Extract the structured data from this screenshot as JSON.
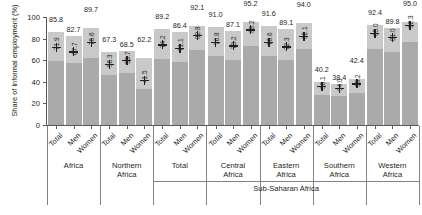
{
  "chart_data": {
    "type": "bar",
    "title": "",
    "xlabel": "",
    "ylabel": "Share of informal employment (%)",
    "ylim": [
      0,
      100
    ],
    "yticks": [
      "0",
      "20",
      "40",
      "60",
      "80",
      "100"
    ],
    "grid": false,
    "legend": "none",
    "categories": [
      "Total",
      "Men",
      "Women",
      "Total",
      "Men",
      "Women",
      "Total",
      "Men",
      "Women",
      "Total",
      "Men",
      "Women",
      "Total",
      "Men",
      "Women",
      "Total",
      "Men",
      "Women",
      "Total",
      "Men",
      "Women"
    ],
    "groups": [
      {
        "label": "Africa",
        "labels": [
          "Total",
          "Men",
          "Women"
        ]
      },
      {
        "label": "Northern\nAfrica",
        "line1": "Northern",
        "line2": "Africa",
        "labels": [
          "Total",
          "Men",
          "Women"
        ]
      },
      {
        "label": "Total",
        "line1": "Total",
        "line2": "",
        "labels": [
          "Total",
          "Men",
          "Women"
        ]
      },
      {
        "label": "Central\nAfrica",
        "line1": "Central",
        "line2": "Africa",
        "labels": [
          "Total",
          "Men",
          "Women"
        ]
      },
      {
        "label": "Eastern\nAfrica",
        "line1": "Eastern",
        "line2": "Africa",
        "labels": [
          "Total",
          "Men",
          "Women"
        ]
      },
      {
        "label": "Southern\nAfrica",
        "line1": "Southern",
        "line2": "Africa",
        "labels": [
          "Total",
          "Men",
          "Women"
        ]
      },
      {
        "label": "Western\nAfrica",
        "line1": "Western",
        "line2": "Africa",
        "labels": [
          "Total",
          "Men",
          "Women"
        ]
      }
    ],
    "supergroup_label": "Sub-Saharan Africa",
    "series": [
      {
        "name": "Share of informal employment (%)",
        "values": [
          85.8,
          82.7,
          89.7,
          67.3,
          68.5,
          62.2,
          89.2,
          86.4,
          92.1,
          91.0,
          87.1,
          95.2,
          91.6,
          89.1,
          94.0,
          40.2,
          38.4,
          42.4,
          92.4,
          89.8,
          95.0
        ]
      },
      {
        "name": "Informal employment in the informal sector (marker)",
        "values": [
          71.9,
          67.7,
          76.6,
          56.3,
          59.7,
          41.5,
          74.2,
          71.1,
          82.8,
          76.8,
          73.2,
          88.2,
          76.6,
          72.3,
          82.1,
          36.1,
          34.0,
          38.2,
          85.0,
          81.0,
          92.3
        ]
      }
    ],
    "series_lower_segment": [
      59.5,
      57.0,
      62.2,
      46.5,
      48.0,
      33.0,
      61.5,
      58.0,
      69.5,
      64.0,
      60.5,
      73.0,
      63.5,
      60.0,
      70.0,
      28.0,
      27.0,
      30.0,
      70.0,
      67.5,
      77.0
    ],
    "value_labels": [
      "85.8",
      "82.7",
      "89.7",
      "67.3",
      "68.5",
      "62.2",
      "89.2",
      "86.4",
      "92.1",
      "91.0",
      "87.1",
      "95.2",
      "91.6",
      "89.1",
      "94.0",
      "40.2",
      "38.4",
      "42.4",
      "92.4",
      "89.8",
      "95.0"
    ],
    "marker_labels": [
      "71.9",
      "67.7",
      "76.6",
      "56.3",
      "59.7",
      "41.5",
      "74.2",
      "71.1",
      "82.8",
      "76.8",
      "73.2",
      "88.2",
      "76.6",
      "72.3",
      "82.1",
      "36.1",
      "34.0",
      "38.2",
      "85.0",
      "81.0",
      "92.3"
    ],
    "colors": {
      "bar_upper": "#c8c9c8",
      "bar_lower": "#a9aaa9",
      "marker": "#231f20",
      "axis": "#58595b"
    }
  }
}
